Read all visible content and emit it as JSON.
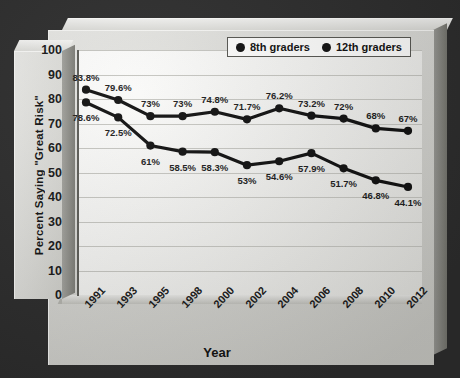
{
  "chart_data": {
    "type": "line",
    "title": "",
    "xlabel": "Year",
    "ylabel": "Percent Saying \"Great Risk\"",
    "ylim": [
      0,
      100
    ],
    "ytick_step": 10,
    "grid": true,
    "legend_position": "top-right",
    "categories": [
      "1991",
      "1993",
      "1995",
      "1998",
      "2000",
      "2002",
      "2004",
      "2006",
      "2008",
      "2010",
      "2012"
    ],
    "yticks": [
      "100",
      "90",
      "80",
      "70",
      "60",
      "50",
      "40",
      "30",
      "20",
      "10",
      "0"
    ],
    "series": [
      {
        "name": "8th graders",
        "color": "#111111",
        "values": [
          83.8,
          79.6,
          73,
          73,
          74.8,
          71.7,
          76.2,
          73.2,
          72,
          68,
          67
        ],
        "labels": [
          "83.8%",
          "79.6%",
          "73%",
          "73%",
          "74.8%",
          "71.7%",
          "76.2%",
          "73.2%",
          "72%",
          "68%",
          "67%"
        ]
      },
      {
        "name": "12th graders",
        "color": "#111111",
        "values": [
          78.6,
          72.5,
          61,
          58.5,
          58.3,
          53,
          54.6,
          57.9,
          51.7,
          46.8,
          44.1
        ],
        "labels": [
          "78.6%",
          "72.5%",
          "61%",
          "58.5%",
          "58.3%",
          "53%",
          "54.6%",
          "57.9%",
          "51.7%",
          "46.8%",
          "44.1%"
        ]
      }
    ]
  },
  "legend": {
    "items": [
      {
        "label": "8th graders",
        "marker": "circle-dot-icon"
      },
      {
        "label": "12th graders",
        "marker": "circle-dot-icon"
      }
    ]
  },
  "axes": {
    "y_title": "Percent Saying \"Great Risk\"",
    "x_title": "Year"
  },
  "colors": {
    "background": "#2d2d2d",
    "panel": "#d8d8d4",
    "plot": "#f6f6f4",
    "gridline": "#c6c6c1",
    "series": "#111111",
    "text": "#141414"
  }
}
